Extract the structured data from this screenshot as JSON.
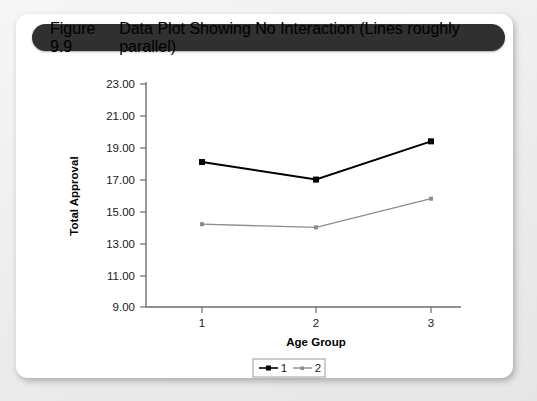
{
  "figure": {
    "number": "Figure 9.9",
    "caption": "Data Plot Showing No Interaction (Lines roughly parallel)"
  },
  "chart_data": {
    "type": "line",
    "title": "",
    "xlabel": "Age Group",
    "ylabel": "Total Approval",
    "categories": [
      "1",
      "2",
      "3"
    ],
    "series": [
      {
        "name": "1",
        "values": [
          18.1,
          17.0,
          19.4
        ],
        "color": "#000000",
        "marker": "square"
      },
      {
        "name": "2",
        "values": [
          14.2,
          14.0,
          15.8
        ],
        "color": "#8c8c8c",
        "marker": "small-square"
      }
    ],
    "ylim": [
      9.0,
      23.0
    ],
    "ytick_step": 2.0,
    "ytick_labels": [
      "23.00",
      "21.00",
      "19.00",
      "17.00",
      "15.00",
      "13.00",
      "11.00",
      "9.00"
    ],
    "xtick_labels": [
      "1",
      "2",
      "3"
    ],
    "grid": false,
    "legend_position": "bottom-center",
    "legend_entries": [
      "1",
      "2"
    ]
  },
  "colors": {
    "header_bar": "#303030",
    "card": "#ffffff",
    "page_background": "#f2f2f2",
    "axis": "#6d6d6d",
    "series_1": "#000000",
    "series_2": "#8c8c8c"
  }
}
